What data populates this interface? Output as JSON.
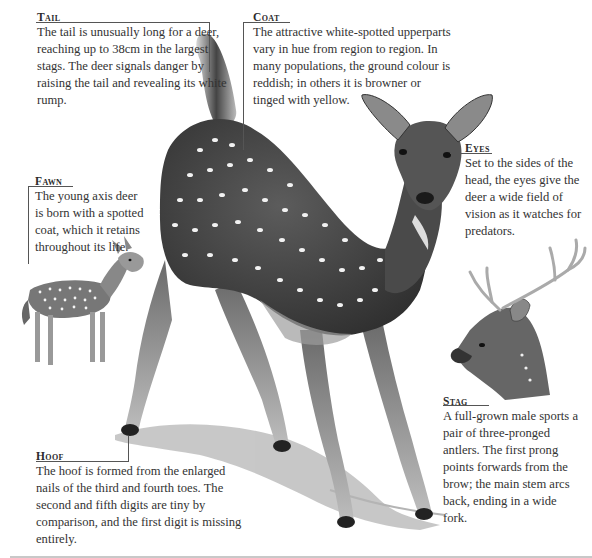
{
  "callouts": {
    "tail": {
      "title": "Tail",
      "text": "The tail is unusually long for a deer, reaching up to 38cm in the largest stags. The deer signals danger by raising the tail and revealing its white rump."
    },
    "coat": {
      "title": "Coat",
      "text": "The attractive white-spotted upperparts vary in hue from region to region. In many populations, the ground colour is reddish; in others it is browner or tinged with yellow."
    },
    "eyes": {
      "title": "Eyes",
      "text": "Set to the sides of the head, the eyes give the deer a wide field of vision as it watches for predators."
    },
    "fawn": {
      "title": "Fawn",
      "text": "The young axis deer is born with a spotted coat, which it retains throughout its life."
    },
    "stag": {
      "title": "Stag",
      "text": "A full-grown male sports a pair of three-pronged antlers. The first prong points forwards from the brow; the main stem arcs back, ending in a wide fork."
    },
    "hoof": {
      "title": "Hoof",
      "text": "The hoof is formed from the enlarged nails of the third and fourth toes. The second and fifth digits are tiny by comparison, and the first digit is missing entirely."
    }
  },
  "illustrations": {
    "main": "axis-deer-adult",
    "fawn": "axis-deer-fawn",
    "stag": "axis-deer-stag-head"
  },
  "colors": {
    "ink": "#2a2a2a",
    "leader": "#555555",
    "coat_dark": "#4a4a4a",
    "spot": "#f2f2f2"
  }
}
